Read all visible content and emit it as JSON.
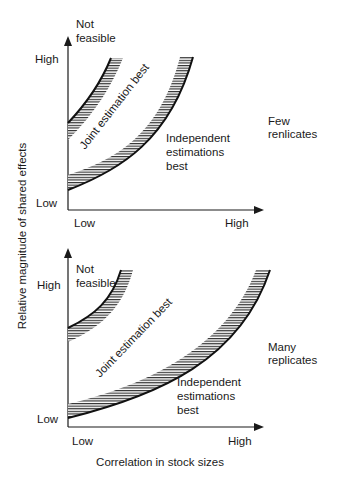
{
  "figure": {
    "y_axis_label": "Relative magnitude of shared effects",
    "x_axis_label": "Correlation in stock sizes",
    "colors": {
      "ink": "#1a1a1a",
      "background": "#ffffff"
    }
  },
  "panels": [
    {
      "condition_label_line1": "Few",
      "condition_label_line2": "renlicates",
      "y_tick_high": "High",
      "y_tick_low": "Low",
      "x_tick_low": "Low",
      "x_tick_high": "High",
      "region_not_feasible_line1": "Not",
      "region_not_feasible_line2": "feasible",
      "region_joint": "Joint estimation best",
      "region_independent_line1": "Independent",
      "region_independent_line2": "estimations",
      "region_independent_line3": "best"
    },
    {
      "condition_label_line1": "Many",
      "condition_label_line2": "replicates",
      "y_tick_high": "High",
      "y_tick_low": "Low",
      "x_tick_low": "Low",
      "x_tick_high": "High",
      "region_not_feasible_line1": "Not",
      "region_not_feasible_line2": "feasible",
      "region_joint": "Joint estimation best",
      "region_independent_line1": "Independent",
      "region_independent_line2": "estimations",
      "region_independent_line3": "best"
    }
  ]
}
